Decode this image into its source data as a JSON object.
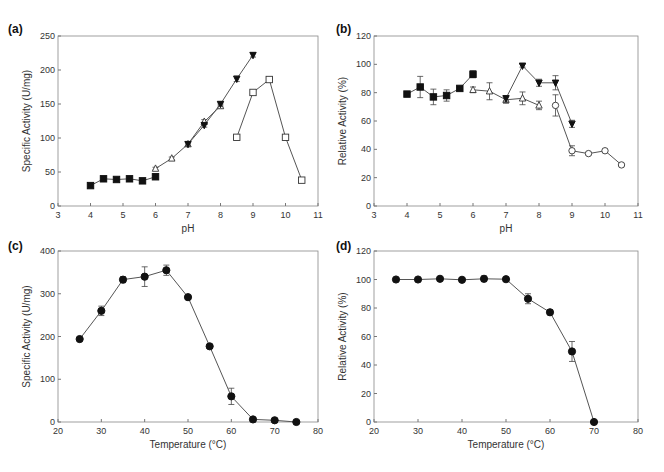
{
  "figure": {
    "panels": [
      {
        "id": "a",
        "label": "(a)"
      },
      {
        "id": "b",
        "label": "(b)"
      },
      {
        "id": "c",
        "label": "(c)"
      },
      {
        "id": "d",
        "label": "(d)"
      }
    ]
  },
  "chart_data": [
    {
      "panel": "(a)",
      "type": "line",
      "title": "",
      "xlabel": "pH",
      "ylabel": "Specific Activity (U/mg)",
      "xlim": [
        3,
        11
      ],
      "ylim": [
        0,
        250
      ],
      "xticks": [
        3,
        4,
        5,
        6,
        7,
        8,
        9,
        10,
        11
      ],
      "yticks": [
        0,
        50,
        100,
        150,
        200,
        250
      ],
      "grid": false,
      "legend": "none",
      "series": [
        {
          "name": "buffer 1 (filled square)",
          "marker": "square-filled",
          "x": [
            4.0,
            4.4,
            4.8,
            5.2,
            5.6,
            6.0
          ],
          "y": [
            30,
            40,
            39,
            40,
            37,
            43
          ],
          "err": [
            2,
            2,
            2,
            2,
            2,
            2
          ]
        },
        {
          "name": "buffer 2 (open triangle)",
          "marker": "triangle-open",
          "x": [
            6.0,
            6.5,
            7.0,
            7.5,
            8.0
          ],
          "y": [
            55,
            70,
            91,
            124,
            147
          ],
          "err": [
            2,
            2,
            3,
            3,
            3
          ]
        },
        {
          "name": "buffer 3 (filled inverted triangle)",
          "marker": "triangle-down-filled",
          "x": [
            7.0,
            7.5,
            8.0,
            8.5,
            9.0
          ],
          "y": [
            91,
            119,
            150,
            187,
            222
          ],
          "err": [
            3,
            3,
            3,
            4,
            3
          ]
        },
        {
          "name": "buffer 4 (open square)",
          "marker": "square-open",
          "x": [
            8.5,
            9.0,
            9.5,
            10.0,
            10.5
          ],
          "y": [
            101,
            167,
            186,
            101,
            38
          ],
          "err": [
            2,
            3,
            2,
            2,
            3
          ]
        }
      ]
    },
    {
      "panel": "(b)",
      "type": "line",
      "title": "",
      "xlabel": "pH",
      "ylabel": "Relative Activity (%)",
      "xlim": [
        3,
        11
      ],
      "ylim": [
        0,
        120
      ],
      "xticks": [
        3,
        4,
        5,
        6,
        7,
        8,
        9,
        10,
        11
      ],
      "yticks": [
        0,
        20,
        40,
        60,
        80,
        100,
        120
      ],
      "grid": false,
      "legend": "none",
      "series": [
        {
          "name": "buffer 1 (filled square)",
          "marker": "square-filled",
          "x": [
            4.0,
            4.4,
            4.8,
            5.2,
            5.6,
            6.0
          ],
          "y": [
            79,
            84,
            77,
            78,
            83,
            93
          ],
          "err": [
            1.5,
            7.5,
            5.5,
            4,
            1,
            2.5
          ]
        },
        {
          "name": "buffer 2 (open triangle)",
          "marker": "triangle-open",
          "x": [
            6.0,
            6.5,
            7.0,
            7.5,
            8.0
          ],
          "y": [
            82,
            81,
            75,
            76,
            71
          ],
          "err": [
            2,
            6,
            2.5,
            4.5,
            3
          ]
        },
        {
          "name": "buffer 3 (filled inverted triangle)",
          "marker": "triangle-down-filled",
          "x": [
            7.0,
            7.5,
            8.0,
            8.5,
            9.0
          ],
          "y": [
            76,
            99,
            87,
            87,
            58
          ],
          "err": [
            2,
            1,
            2.5,
            5,
            2.5
          ]
        },
        {
          "name": "buffer 4 (open circle)",
          "marker": "circle-open",
          "x": [
            8.5,
            9.0,
            9.5,
            10.0,
            10.5
          ],
          "y": [
            71,
            39,
            37,
            39,
            29
          ],
          "err": [
            7.5,
            3.5,
            0.8,
            1,
            1
          ]
        }
      ]
    },
    {
      "panel": "(c)",
      "type": "line",
      "title": "",
      "xlabel": "Temperature (°C)",
      "ylabel": "Specific Activity (U/mg)",
      "xlim": [
        20,
        80
      ],
      "ylim": [
        0,
        400
      ],
      "xticks": [
        20,
        30,
        40,
        50,
        60,
        70,
        80
      ],
      "yticks": [
        0,
        100,
        200,
        300,
        400
      ],
      "grid": false,
      "legend": "none",
      "series": [
        {
          "name": "activity",
          "marker": "circle-filled",
          "x": [
            25,
            30,
            35,
            40,
            45,
            50,
            55,
            60,
            65,
            70,
            75
          ],
          "y": [
            194,
            260,
            333,
            340,
            355,
            292,
            177,
            60,
            6,
            4,
            0
          ],
          "err": [
            3,
            11,
            7,
            23,
            12,
            3,
            4,
            19,
            3,
            2,
            1
          ]
        }
      ]
    },
    {
      "panel": "(d)",
      "type": "line",
      "title": "",
      "xlabel": "Temperature (°C)",
      "ylabel": "Relative Activity (%)",
      "xlim": [
        20,
        80
      ],
      "ylim": [
        0,
        120
      ],
      "xticks": [
        20,
        30,
        40,
        50,
        60,
        70,
        80
      ],
      "yticks": [
        0,
        20,
        40,
        60,
        80,
        100,
        120
      ],
      "grid": false,
      "legend": "none",
      "series": [
        {
          "name": "thermostability",
          "marker": "circle-filled",
          "x": [
            25,
            30,
            35,
            40,
            45,
            50,
            55,
            60,
            65,
            70
          ],
          "y": [
            100,
            100,
            100.5,
            99.8,
            100.5,
            100.2,
            86.5,
            77,
            49.5,
            0
          ],
          "err": [
            0.8,
            0.5,
            0.8,
            1.2,
            2,
            1,
            3.5,
            1.8,
            7,
            0
          ]
        }
      ]
    }
  ]
}
